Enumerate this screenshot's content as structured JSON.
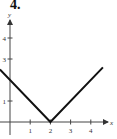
{
  "problem_number": "4.",
  "chart_data": {
    "type": "line",
    "title": "",
    "xlabel": "x",
    "ylabel": "y",
    "xlim": [
      -0.5,
      4.8
    ],
    "ylim": [
      -0.2,
      4.8
    ],
    "x_ticks": [
      1,
      2,
      3,
      4
    ],
    "y_ticks": [
      1,
      3,
      4
    ],
    "grid": false,
    "series": [
      {
        "name": "y = |x - 2|",
        "x": [
          -0.5,
          2,
          4.6
        ],
        "y": [
          2.5,
          0,
          2.6
        ]
      }
    ]
  }
}
